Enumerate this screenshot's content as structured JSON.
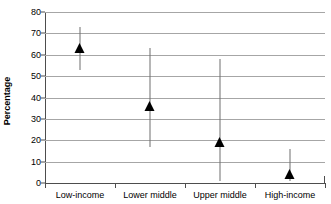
{
  "top_clip_text": "",
  "chart_data": {
    "type": "scatter",
    "title": "",
    "xlabel": "",
    "ylabel": "Percentage",
    "ylim": [
      0,
      80
    ],
    "yticks": [
      0,
      10,
      20,
      30,
      40,
      50,
      60,
      70,
      80
    ],
    "ytick_labels": [
      "0",
      "10",
      "20",
      "30",
      "40",
      "50",
      "60",
      "70",
      "80"
    ],
    "grid": true,
    "legend": "none",
    "categories": [
      "Low-income",
      "Lower middle",
      "Upper middle",
      "High-income"
    ],
    "values": [
      63,
      36,
      19,
      4
    ],
    "error_low": [
      53,
      17,
      1,
      1
    ],
    "error_high": [
      73,
      63,
      58,
      16
    ],
    "marker_shape": "triangle-up",
    "marker_color": "#000000",
    "whisker_color": "#6e6e6e",
    "gridline_color": "#a6a6a6",
    "axis_color": "#4d4d4d",
    "series": [
      {
        "name": "Percentage",
        "points": [
          {
            "category": "Low-income",
            "value": 63,
            "low": 53,
            "high": 73
          },
          {
            "category": "Lower middle",
            "value": 36,
            "low": 17,
            "high": 63
          },
          {
            "category": "Upper middle",
            "value": 19,
            "low": 1,
            "high": 58
          },
          {
            "category": "High-income",
            "value": 4,
            "low": 1,
            "high": 16
          }
        ]
      }
    ]
  }
}
